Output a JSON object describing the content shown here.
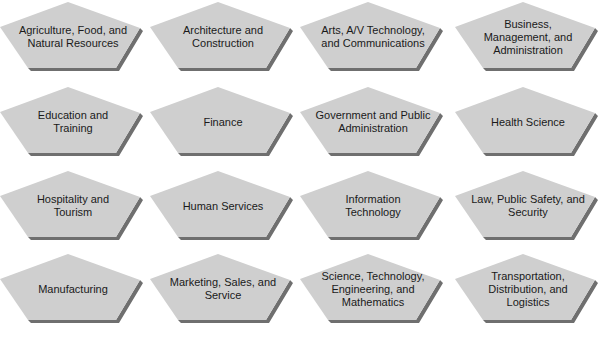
{
  "diagram": {
    "type": "grid-of-pentagons",
    "colors": {
      "shape_fill": "#cfcfcf",
      "shape_shadow": "#6f6f6f",
      "text": "#1a1a1a",
      "background": "#ffffff"
    },
    "clusters": [
      {
        "label": "Agriculture, Food, and\nNatural Resources"
      },
      {
        "label": "Architecture and\nConstruction"
      },
      {
        "label": "Arts, A/V Technology,\nand Communications"
      },
      {
        "label": "Business,\nManagement, and\nAdministration"
      },
      {
        "label": "Education and\nTraining"
      },
      {
        "label": "Finance"
      },
      {
        "label": "Government and Public\nAdministration"
      },
      {
        "label": "Health Science"
      },
      {
        "label": "Hospitality and\nTourism"
      },
      {
        "label": "Human Services"
      },
      {
        "label": "Information\nTechnology"
      },
      {
        "label": "Law, Public Safety, and\nSecurity"
      },
      {
        "label": "Manufacturing"
      },
      {
        "label": "Marketing, Sales, and\nService"
      },
      {
        "label": "Science, Technology,\nEngineering, and\nMathematics"
      },
      {
        "label": "Transportation,\nDistribution, and\nLogistics"
      }
    ]
  }
}
